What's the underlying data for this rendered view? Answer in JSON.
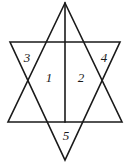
{
  "figure": {
    "name": "hexagram-star-figure",
    "stroke_color": "#1a1a1a",
    "background_color": "#ffffff",
    "width": 129,
    "height": 166
  },
  "labels": [
    {
      "id": "region-1",
      "text": "1",
      "x": 49,
      "y": 77,
      "region": "center-left"
    },
    {
      "id": "region-2",
      "text": "2",
      "x": 81,
      "y": 77,
      "region": "center-right"
    },
    {
      "id": "region-3",
      "text": "3",
      "x": 27,
      "y": 57,
      "region": "left-point"
    },
    {
      "id": "region-4",
      "text": "4",
      "x": 104,
      "y": 57,
      "region": "right-point"
    },
    {
      "id": "region-5",
      "text": "5",
      "x": 66,
      "y": 135,
      "region": "bottom-point"
    }
  ],
  "geometry": {
    "up_triangle": "65,3 122,122 8,122",
    "down_triangle": "10,42 120,42 65,160",
    "median_line": {
      "x1": 65,
      "y1": 3,
      "x2": 65,
      "y2": 122
    }
  }
}
